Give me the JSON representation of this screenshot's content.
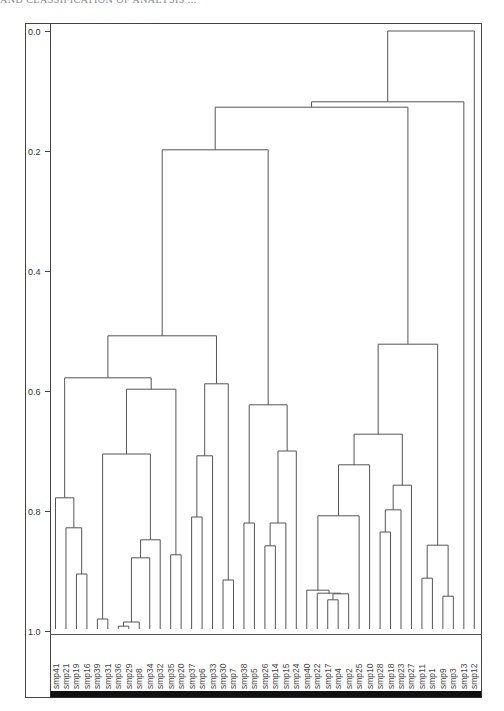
{
  "header": {
    "text": "AND CLASSIFICATION OF ANALYSIS ..."
  },
  "chart_data": {
    "type": "dendrogram",
    "title": "",
    "xlabel": "",
    "ylabel": "",
    "ylim": [
      0.0,
      1.0
    ],
    "y_inverted": true,
    "yticks": [
      "0.0",
      "0.2",
      "0.4",
      "0.6",
      "0.8",
      "1.0"
    ],
    "ytick_values": [
      0.0,
      0.2,
      0.4,
      0.6,
      0.8,
      1.0
    ],
    "grid": false,
    "leaves": [
      "smp41",
      "smp21",
      "smp19",
      "smp16",
      "smp39",
      "smp31",
      "smp36",
      "smp29",
      "smp8",
      "smp34",
      "smp32",
      "smp35",
      "smp20",
      "smp37",
      "smp6",
      "smp33",
      "smp30",
      "smp7",
      "smp38",
      "smp5",
      "smp26",
      "smp14",
      "smp15",
      "smp24",
      "smp40",
      "smp22",
      "smp17",
      "smp4",
      "smp2",
      "smp25",
      "smp10",
      "smp28",
      "smp18",
      "smp23",
      "smp27",
      "smp11",
      "smp1",
      "smp9",
      "smp3",
      "smp13",
      "smp12"
    ],
    "merges": [
      {
        "id": "n1",
        "left": "smp19",
        "right": "smp16",
        "height": 0.905
      },
      {
        "id": "n2",
        "left": "smp21",
        "right": "n1",
        "height": 0.828
      },
      {
        "id": "n3",
        "left": "smp41",
        "right": "n2",
        "height": 0.778
      },
      {
        "id": "n4",
        "left": "smp39",
        "right": "smp31",
        "height": 0.98
      },
      {
        "id": "n5",
        "left": "smp36",
        "right": "smp29",
        "height": 0.992
      },
      {
        "id": "n6",
        "left": "n5",
        "right": "smp8",
        "height": 0.985
      },
      {
        "id": "n7",
        "left": "n6",
        "right": "smp34",
        "height": 0.878
      },
      {
        "id": "n8",
        "left": "n7",
        "right": "smp32",
        "height": 0.848
      },
      {
        "id": "n9",
        "left": "n4",
        "right": "n8",
        "height": 0.705
      },
      {
        "id": "n10",
        "left": "smp35",
        "right": "smp20",
        "height": 0.873
      },
      {
        "id": "n11",
        "left": "n9",
        "right": "n10",
        "height": 0.597
      },
      {
        "id": "n12",
        "left": "n3",
        "right": "n11",
        "height": 0.578
      },
      {
        "id": "n13",
        "left": "smp37",
        "right": "smp6",
        "height": 0.81
      },
      {
        "id": "n14",
        "left": "n13",
        "right": "smp33",
        "height": 0.708
      },
      {
        "id": "n15",
        "left": "smp30",
        "right": "smp7",
        "height": 0.915
      },
      {
        "id": "n16",
        "left": "n14",
        "right": "n15",
        "height": 0.588
      },
      {
        "id": "n17",
        "left": "n12",
        "right": "n16",
        "height": 0.508
      },
      {
        "id": "n18",
        "left": "smp38",
        "right": "smp5",
        "height": 0.82
      },
      {
        "id": "n19",
        "left": "smp26",
        "right": "smp14",
        "height": 0.858
      },
      {
        "id": "n20",
        "left": "n19",
        "right": "smp15",
        "height": 0.82
      },
      {
        "id": "n21",
        "left": "n20",
        "right": "smp24",
        "height": 0.7
      },
      {
        "id": "n22",
        "left": "n18",
        "right": "n21",
        "height": 0.623
      },
      {
        "id": "n23",
        "left": "n17",
        "right": "n22",
        "height": 0.198
      },
      {
        "id": "n24",
        "left": "smp17",
        "right": "smp4",
        "height": 0.948
      },
      {
        "id": "n25",
        "left": "n24",
        "right": "smp2",
        "height": 0.938
      },
      {
        "id": "n26",
        "left": "smp22",
        "right": "n25",
        "height": 0.937
      },
      {
        "id": "n27",
        "left": "smp40",
        "right": "n26",
        "height": 0.932
      },
      {
        "id": "n28",
        "left": "n27",
        "right": "smp25",
        "height": 0.808
      },
      {
        "id": "n29",
        "left": "n28",
        "right": "smp10",
        "height": 0.723
      },
      {
        "id": "n30",
        "left": "smp28",
        "right": "smp18",
        "height": 0.835
      },
      {
        "id": "n31",
        "left": "n30",
        "right": "smp23",
        "height": 0.798
      },
      {
        "id": "n32",
        "left": "n31",
        "right": "smp27",
        "height": 0.757
      },
      {
        "id": "n33",
        "left": "n29",
        "right": "n32",
        "height": 0.672
      },
      {
        "id": "n34",
        "left": "smp11",
        "right": "smp1",
        "height": 0.912
      },
      {
        "id": "n35",
        "left": "smp9",
        "right": "smp3",
        "height": 0.942
      },
      {
        "id": "n36",
        "left": "n34",
        "right": "n35",
        "height": 0.857
      },
      {
        "id": "n37",
        "left": "n33",
        "right": "n36",
        "height": 0.522
      },
      {
        "id": "n38",
        "left": "n23",
        "right": "n37",
        "height": 0.127
      },
      {
        "id": "n39",
        "left": "n38",
        "right": "smp13",
        "height": 0.118
      },
      {
        "id": "n40",
        "left": "n39",
        "right": "smp12",
        "height": 0.0
      }
    ],
    "colors": {
      "line": "#555555",
      "frame": "#444444",
      "bar": "#111111"
    }
  }
}
